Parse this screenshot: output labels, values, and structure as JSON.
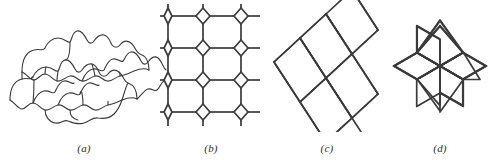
{
  "plate": {
    "background_color": "#ffffff",
    "stroke_color": "#3a3a3a",
    "caption_color": "#2b2b2b"
  },
  "figures": [
    {
      "id": "a",
      "caption": "(a)",
      "name": "escher-bat-tessellation",
      "description": "Interlocking curved bat-like tiles forming a periodic tessellation",
      "stroke_width": 1.1,
      "tile_columns": 3,
      "tile_rows": 3
    },
    {
      "id": "b",
      "caption": "(b)",
      "name": "square-lattice-with-diamond-nodes",
      "description": "Square grid of line segments with small rotated-square (diamond) nodes at each lattice point",
      "stroke_width": 1.6,
      "grid_columns": 3,
      "grid_rows": 4,
      "node_size": 9
    },
    {
      "id": "c",
      "caption": "(c)",
      "name": "rhombic-tiling-parallelogram",
      "description": "Rhombi tiled edge to edge in a slanted parallelogram block",
      "stroke_width": 1.6,
      "rhombi_columns": 3,
      "rhombi_rows": 3
    },
    {
      "id": "d",
      "caption": "(d)",
      "name": "six-rhombus-star",
      "description": "Six-pointed star formed by six 60/120-degree rhombi meeting at a common center",
      "stroke_width": 1.6,
      "rhombus_count": 6
    }
  ]
}
